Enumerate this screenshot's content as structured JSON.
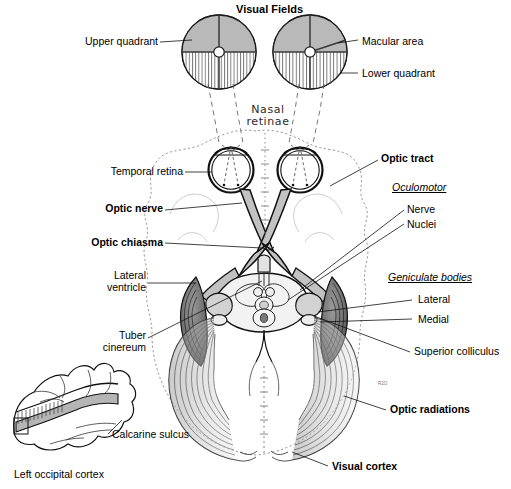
{
  "figure": {
    "title": "Visual Fields",
    "background_color": "#ffffff",
    "ink_color": "#000000",
    "shade_gray": "#b3b3b3",
    "light_gray": "#d9d9d9",
    "artist_mark": "R2O"
  },
  "visual_fields": {
    "heading": "Visual Fields",
    "left_circle": {
      "upper_quadrant_fill": "shaded",
      "lower_quadrant_fill": "vertical-hatch"
    },
    "right_circle": {
      "upper_quadrant_fill": "shaded",
      "lower_quadrant_fill": "vertical-hatch",
      "macular_wedge": "upper-right"
    },
    "labels": {
      "upper_quadrant": "Upper quadrant",
      "macular_area": "Macular area",
      "lower_quadrant": "Lower quadrant"
    }
  },
  "annotations": {
    "nasal_retinae": "Nasal\nretinae",
    "temporal_retina": "Temporal retina",
    "optic_nerve": "Optic nerve",
    "optic_chiasma": "Optic chiasma",
    "optic_tract": "Optic tract",
    "lateral_ventricle": "Lateral\nventricle",
    "tuber_cinereum": "Tuber\ncinereum",
    "superior_colliculus": "Superior colliculus",
    "optic_radiations": "Optic radiations",
    "visual_cortex": "Visual cortex",
    "calcarine_sulcus": "Calcarine sulcus",
    "left_occipital_cortex": "Left occipital cortex"
  },
  "groups": {
    "oculomotor": {
      "heading": "Oculomotor",
      "items": [
        "Nerve",
        "Nuclei"
      ]
    },
    "geniculate_bodies": {
      "heading": "Geniculate bodies",
      "items": [
        "Lateral",
        "Medial"
      ]
    }
  }
}
